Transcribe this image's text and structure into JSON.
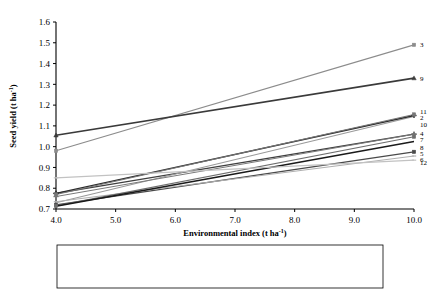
{
  "chart_data": {
    "type": "line",
    "title": "",
    "xlabel": "Environmental index (t ha-1)",
    "xlabel_main": "Environmental index (t ha",
    "xlabel_sup": "-1",
    "xlabel_tail": ")",
    "ylabel": "Seed yield (t ha-1)",
    "ylabel_main": "Seed yield (t ha",
    "ylabel_sup": "-1",
    "ylabel_tail": ")",
    "xlim": [
      4.0,
      10.0
    ],
    "ylim": [
      0.7,
      1.6
    ],
    "grid": false,
    "legend_position": "bottom",
    "x_ticks": [
      "4.0",
      "5.0",
      "6.0",
      "7.0",
      "8.0",
      "9.0",
      "10.0"
    ],
    "x_tick_values": [
      4.0,
      5.0,
      6.0,
      7.0,
      8.0,
      9.0,
      10.0
    ],
    "y_ticks": [
      "0.7",
      "0.8",
      "0.9",
      "1.0",
      "1.1",
      "1.2",
      "1.3",
      "1.4",
      "1.5",
      "1.6"
    ],
    "y_tick_values": [
      0.7,
      0.8,
      0.9,
      1.0,
      1.1,
      1.2,
      1.3,
      1.4,
      1.5,
      1.6
    ],
    "x": [
      4.0,
      10.0
    ],
    "series": [
      {
        "id": 1,
        "name": "1-Tarım Beyazı -98",
        "values": [
          0.775,
          1.06
        ],
        "color": "#3f3f3f",
        "width": 1.3,
        "marker": "cross",
        "end_label": "4"
      },
      {
        "id": 2,
        "name": "2- Line-3",
        "values": [
          0.73,
          1.145
        ],
        "color": "#9a9a9a",
        "width": 1.1,
        "marker": "none",
        "end_label": "2"
      },
      {
        "id": 3,
        "name": "3-Anadolu Pembesi-2002",
        "values": [
          0.98,
          1.49
        ],
        "color": "#8c8c8c",
        "width": 1.1,
        "marker": "square",
        "end_label": "3"
      },
      {
        "id": 4,
        "name": "4- Budak",
        "values": [
          0.76,
          1.06
        ],
        "color": "#7a7a7a",
        "width": 1.0,
        "marker": "cross",
        "end_label": "4"
      },
      {
        "id": 5,
        "name": "5- Line-10",
        "values": [
          0.72,
          0.975
        ],
        "color": "#4a4a4a",
        "width": 1.3,
        "marker": "square",
        "end_label": "5"
      },
      {
        "id": 6,
        "name": "6-Ege Beyazı-79",
        "values": [
          0.735,
          0.955
        ],
        "color": "#b0b0b0",
        "width": 1.0,
        "marker": "dash",
        "end_label": "6"
      },
      {
        "id": 7,
        "name": "7- Line -2109",
        "values": [
          0.715,
          1.048
        ],
        "color": "#6e6e6e",
        "width": 1.1,
        "marker": "square",
        "end_label": "7"
      },
      {
        "id": 8,
        "name": "8- Line-15",
        "values": [
          0.713,
          1.025
        ],
        "color": "#1a1a1a",
        "width": 1.5,
        "marker": "none",
        "end_label": "8"
      },
      {
        "id": 9,
        "name": "9-Oğuz -2002",
        "values": [
          1.055,
          1.33
        ],
        "color": "#3a3a3a",
        "width": 1.7,
        "marker": "triangle",
        "end_label": "9"
      },
      {
        "id": 10,
        "name": "10- Line-18",
        "values": [
          0.775,
          1.15
        ],
        "color": "#2b2b2b",
        "width": 1.4,
        "marker": "cross",
        "end_label": "10"
      },
      {
        "id": 11,
        "name": "11- Beta",
        "values": [
          0.77,
          1.155
        ],
        "color": "#777777",
        "width": 1.1,
        "marker": "square",
        "end_label": "11"
      },
      {
        "id": 12,
        "name": "12- Line-55",
        "values": [
          0.85,
          0.935
        ],
        "color": "#c2c2c2",
        "width": 1.2,
        "marker": "dash",
        "end_label": "12"
      }
    ],
    "end_labels": [
      {
        "text": "3",
        "value": 1.49
      },
      {
        "text": "9",
        "value": 1.33
      },
      {
        "text": "11",
        "value": 1.17
      },
      {
        "text": "2",
        "value": 1.14
      },
      {
        "text": "10",
        "value": 1.105
      },
      {
        "text": "4",
        "value": 1.062
      },
      {
        "text": "7",
        "value": 1.035
      },
      {
        "text": "8",
        "value": 0.995
      },
      {
        "text": "5",
        "value": 0.965
      },
      {
        "text": "6",
        "value": 0.94
      },
      {
        "text": "12",
        "value": 0.922
      }
    ]
  },
  "legend": {
    "columns": 3,
    "rows": [
      [
        "1-Tarım Beyazı -98",
        "2- Line-3",
        "3-Anadolu Pembesi-2002"
      ],
      [
        "4- Budak",
        "5- Line-10",
        "6-Ege Beyazı-79"
      ],
      [
        "7- Line -2109",
        "8- Line-15",
        "9-Oğuz -2002"
      ],
      [
        "10- Line-18",
        "11- Beta",
        "12- Line-55"
      ]
    ]
  }
}
